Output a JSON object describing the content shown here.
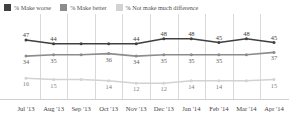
{
  "legend": {
    "items": [
      {
        "label": "% Make worse",
        "color": "#404040",
        "key": "worse"
      },
      {
        "label": "% Make better",
        "color": "#8c8c8c",
        "key": "better"
      },
      {
        "label": "% Not make much difference",
        "color": "#d2d2d2",
        "key": "nodiff"
      }
    ]
  },
  "chart_data": {
    "type": "line",
    "title": "",
    "xlabel": "",
    "ylabel": "",
    "ylim": [
      0,
      60
    ],
    "grid": true,
    "legend_position": "top-left",
    "categories": [
      "Jul '13",
      "Aug '13",
      "Sep '13",
      "Oct '13",
      "Nov '13",
      "Dec '13",
      "Jan '14",
      "Feb '14",
      "Mar '14",
      "Apr '14"
    ],
    "series": [
      {
        "name": "% Make worse",
        "color": "#404040",
        "values": [
          47,
          44,
          44,
          44,
          44,
          48,
          48,
          45,
          48,
          45
        ],
        "labels": [
          "47",
          "44",
          "",
          "",
          "44",
          "48",
          "48",
          "45",
          "48",
          "45"
        ],
        "label_position": "above"
      },
      {
        "name": "% Make better",
        "color": "#8c8c8c",
        "values": [
          34,
          35,
          35,
          36,
          34,
          35,
          35,
          35,
          35,
          37
        ],
        "labels": [
          "34",
          "35",
          "",
          "36",
          "34",
          "35",
          "35",
          "35",
          "",
          "37"
        ],
        "label_position": "below"
      },
      {
        "name": "% Not make much difference",
        "color": "#d2d2d2",
        "values": [
          16,
          15,
          15,
          14,
          12,
          12,
          14,
          14,
          14,
          15
        ],
        "labels": [
          "16",
          "15",
          "",
          "14",
          "12",
          "12",
          "14",
          "14",
          "",
          "15"
        ],
        "label_position": "below"
      }
    ]
  }
}
